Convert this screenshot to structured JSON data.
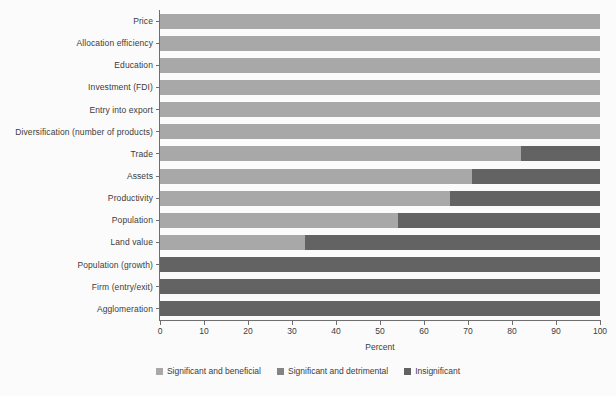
{
  "chart_data": {
    "type": "bar",
    "orientation": "horizontal",
    "stacked": true,
    "stack_total": 100,
    "title": "",
    "xlabel": "Percent",
    "ylabel": "",
    "xlim": [
      0,
      100
    ],
    "xticks": [
      0,
      10,
      20,
      30,
      40,
      50,
      60,
      70,
      80,
      90,
      100
    ],
    "xticklabels": [
      "0",
      "10",
      "20",
      "30",
      "40",
      "50",
      "60",
      "70",
      "80",
      "90",
      "100"
    ],
    "grid": false,
    "legend_position": "bottom-center",
    "categories": [
      "Price",
      "Allocation efficiency",
      "Education",
      "Investment (FDI)",
      "Entry into export",
      "Diversification (number of products)",
      "Trade",
      "Assets",
      "Productivity",
      "Population",
      "Land value",
      "Population (growth)",
      "Firm (entry/exit)",
      "Agglomeration"
    ],
    "series": [
      {
        "name": "Significant and beneficial",
        "color": "#a8a8a8",
        "values": [
          100,
          100,
          100,
          100,
          100,
          100,
          82,
          71,
          66,
          54,
          33,
          0,
          0,
          0
        ]
      },
      {
        "name": "Significant and detrimental",
        "color": "#848484",
        "values": [
          0,
          0,
          0,
          0,
          0,
          0,
          0,
          0,
          0,
          0,
          0,
          0,
          0,
          0
        ]
      },
      {
        "name": "Insignificant",
        "color": "#636363",
        "values": [
          0,
          0,
          0,
          0,
          0,
          0,
          18,
          29,
          34,
          46,
          67,
          100,
          100,
          100
        ]
      }
    ]
  },
  "legend": {
    "items": [
      {
        "label": "Significant and beneficial",
        "color": "#a8a8a8"
      },
      {
        "label": "Significant and detrimental",
        "color": "#848484"
      },
      {
        "label": "Insignificant",
        "color": "#636363"
      }
    ]
  },
  "colors": {
    "background": "#fbfbfb",
    "axis": "#6f6f6f",
    "text": "#3b3b3b",
    "beneficial": "#a8a8a8",
    "detrimental": "#848484",
    "insignificant": "#636363"
  }
}
